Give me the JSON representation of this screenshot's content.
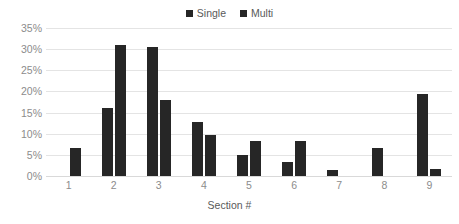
{
  "chart_data": {
    "type": "bar",
    "title": "",
    "xlabel": "Section #",
    "ylabel": "",
    "categories": [
      "1",
      "2",
      "3",
      "4",
      "5",
      "6",
      "7",
      "8",
      "9"
    ],
    "series": [
      {
        "name": "Single",
        "color": "#262626",
        "values": [
          0,
          16.2,
          30.5,
          12.8,
          5.0,
          3.3,
          1.5,
          6.6,
          19.4
        ]
      },
      {
        "name": "Multi",
        "color": "#262626",
        "values": [
          6.6,
          31.0,
          18.0,
          9.8,
          8.3,
          8.3,
          0,
          0,
          1.6
        ]
      }
    ],
    "ylim": [
      0,
      35
    ],
    "ytick_values": [
      0,
      5,
      10,
      15,
      20,
      25,
      30,
      35
    ],
    "ytick_labels": [
      "0%",
      "5%",
      "10%",
      "15%",
      "20%",
      "25%",
      "30%",
      "35%"
    ],
    "grid": true,
    "legend_position": "top-center"
  },
  "legend": {
    "entries": [
      {
        "label": "Single",
        "marker": "square-marker-icon"
      },
      {
        "label": "Multi",
        "marker": "square-marker-icon"
      }
    ]
  },
  "colors": {
    "bar": "#262626",
    "gridline": "#e4e4e4",
    "baseline": "#d9d9d9",
    "tick_text": "#8c8c8c",
    "axis_title_text": "#595959",
    "background": "#ffffff"
  }
}
